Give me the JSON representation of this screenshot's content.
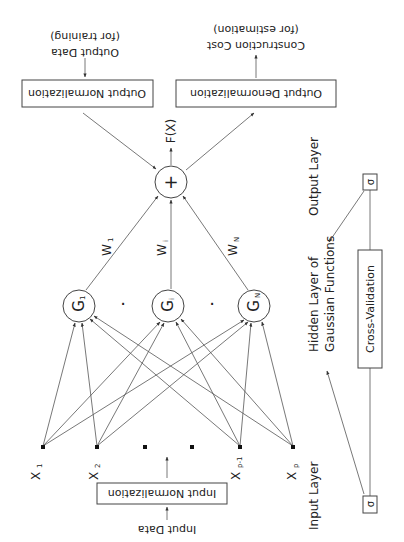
{
  "diagram": {
    "output_data_label": {
      "line1": "Output Data",
      "line2": "(for training)"
    },
    "estimation_label": {
      "line1": "Construction Cost",
      "line2": "(for estimation)"
    },
    "output_normalization": "Output Normalization",
    "output_denormalization": "Output Denormalization",
    "sum_node": "+",
    "output_function": "F(X)",
    "weights": [
      "W",
      "W",
      "W"
    ],
    "weight_subscripts": [
      "1",
      "i",
      "N"
    ],
    "gaussian_nodes": [
      "G",
      "G",
      "G"
    ],
    "gaussian_subscripts": [
      "1",
      "i",
      "N"
    ],
    "inputs": [
      "X",
      "X",
      "X",
      "X"
    ],
    "input_subscripts": [
      "1",
      "2",
      "p-1",
      "p"
    ],
    "input_normalization": "Input Normalization",
    "input_data_label": "Input Data",
    "legend": {
      "input_layer": "Input Layer",
      "hidden_layer_line1": "Hidden Layer of",
      "hidden_layer_line2": "Gaussian Functions",
      "output_layer": "Output Layer",
      "sigma": "σ",
      "cross_validation": "Cross-Validation"
    },
    "ellipsis_dot": "·"
  }
}
